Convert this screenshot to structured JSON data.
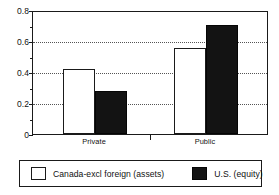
{
  "chart_data": {
    "type": "bar",
    "title": "",
    "xlabel": "",
    "ylabel": "",
    "categories": [
      "Private",
      "Public"
    ],
    "series": [
      {
        "name": "Canada-excl foreign (assets)",
        "color": "#ffffff",
        "values": [
          0.425,
          0.56
        ]
      },
      {
        "name": "U.S. (equity)",
        "color": "#131313",
        "values": [
          0.28,
          0.71
        ]
      }
    ],
    "ylim": [
      0,
      0.8
    ],
    "ytick_labels": [
      "0",
      "0.2",
      "0.4",
      "0.6",
      "0.8"
    ],
    "ytick_values": [
      0,
      0.2,
      0.4,
      0.6,
      0.8
    ],
    "minor_ytick_values": [
      0.1,
      0.3,
      0.5,
      0.7
    ],
    "gridlines_at": [
      0.2,
      0.4,
      0.6
    ],
    "grid": true,
    "legend_position": "bottom"
  },
  "legend": {
    "entries": [
      {
        "label": "Canada-excl foreign (assets)"
      },
      {
        "label": "U.S. (equity)"
      }
    ]
  },
  "axis": {
    "y_labels": [
      "0.8",
      "0.6",
      "0.4",
      "0.2",
      "0"
    ],
    "x_labels": [
      "Private",
      "Public"
    ]
  }
}
